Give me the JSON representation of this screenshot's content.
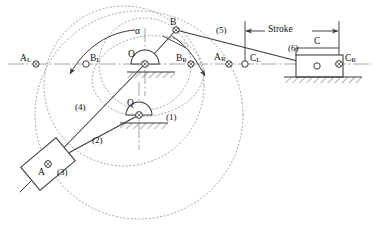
{
  "diagram": {
    "colors": {
      "line": "#3a3a3a",
      "dotted": "#8a8a8a",
      "centerline": "#9a9a9a",
      "text": "#111111",
      "background": "#ffffff"
    },
    "labels": {
      "a_left": "A",
      "a_left_sub": "L",
      "b_left": "B",
      "b_left_sub": "L",
      "o_pivot": "O",
      "alpha": "α",
      "b_top": "B",
      "b_right": "B",
      "b_right_sub": "R",
      "a_right": "A",
      "a_right_sub": "R",
      "c_left": "C",
      "c_left_sub": "L",
      "c_right": "C",
      "c_right_sub": "R",
      "c_center": "C",
      "q_pivot": "Q",
      "a_slider": "A",
      "stroke": "Stroke",
      "link1": "(1)",
      "link2": "(2)",
      "link3": "(3)",
      "link4": "(4)",
      "link5": "(5)",
      "link6": "(6)"
    },
    "points": {
      "A_L": {
        "x": 36,
        "y": 64
      },
      "B_L": {
        "x": 86,
        "y": 64
      },
      "O": {
        "x": 145,
        "y": 64
      },
      "B_R": {
        "x": 191,
        "y": 64
      },
      "A_R": {
        "x": 229,
        "y": 64
      },
      "C_L": {
        "x": 245,
        "y": 64
      },
      "C_R": {
        "x": 339,
        "y": 64
      },
      "B": {
        "x": 176,
        "y": 30
      },
      "Q": {
        "x": 139,
        "y": 115
      },
      "A": {
        "x": 48,
        "y": 164
      },
      "C": {
        "x": 317,
        "y": 66
      }
    },
    "stroke_dimension": {
      "left_x": 245,
      "right_x": 339,
      "y": 31,
      "label": "Stroke"
    }
  }
}
